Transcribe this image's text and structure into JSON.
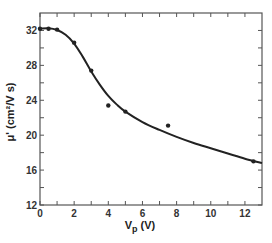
{
  "chart_data": {
    "type": "scatter",
    "title": "",
    "xlabel": "V_p (V)",
    "xlabel_main": "V",
    "xlabel_sub": "p",
    "xlabel_unit": " (V)",
    "ylabel": "μ' (cm²/V s)",
    "xlim": [
      0,
      13
    ],
    "ylim": [
      12,
      34
    ],
    "x_ticks_major": [
      0,
      2,
      4,
      6,
      8,
      10,
      12
    ],
    "x_tick_labels": [
      "0",
      "2",
      "4",
      "6",
      "8",
      "10",
      "12"
    ],
    "x_ticks_minor": [
      1,
      3,
      5,
      7,
      9,
      11
    ],
    "y_ticks_major": [
      12,
      16,
      20,
      24,
      28,
      32
    ],
    "y_tick_labels": [
      "12",
      "16",
      "20",
      "24",
      "28",
      "32"
    ],
    "y_ticks_minor": [
      14,
      18,
      22,
      26,
      30
    ],
    "grid": false,
    "legend": null,
    "series": [
      {
        "name": "measured",
        "style": "markers",
        "x": [
          0,
          0.5,
          1,
          2,
          3,
          4,
          5,
          7.5,
          12.5
        ],
        "y": [
          32.2,
          32.2,
          32.1,
          30.6,
          27.4,
          23.4,
          22.7,
          21.1,
          17.0
        ]
      },
      {
        "name": "fit",
        "style": "line",
        "x": [
          0,
          0.5,
          1,
          1.5,
          2,
          2.5,
          3,
          3.5,
          4,
          4.5,
          5,
          6,
          7,
          8,
          9,
          10,
          11,
          12,
          13
        ],
        "y": [
          32.2,
          32.25,
          32.05,
          31.5,
          30.5,
          29.0,
          27.3,
          25.8,
          24.5,
          23.5,
          22.7,
          21.5,
          20.6,
          19.8,
          19.1,
          18.5,
          17.9,
          17.3,
          16.8
        ]
      }
    ],
    "colors": {
      "axis": "#555555",
      "data": "#222222",
      "line": "#222222"
    }
  }
}
